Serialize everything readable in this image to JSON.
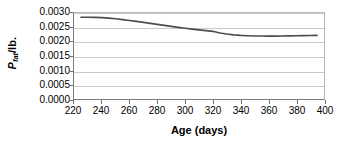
{
  "chart_data": {
    "type": "line",
    "title": "",
    "xlabel": "Age (days)",
    "ylabel": "P_fat/lb.",
    "ylabel_parts": {
      "symbol": "P",
      "subscript": "fat",
      "unit": "/lb."
    },
    "xlim": [
      220,
      400
    ],
    "ylim": [
      0.0,
      0.003
    ],
    "grid": true,
    "grid_axis": "y",
    "legend": "none",
    "xticks": [
      220,
      240,
      260,
      280,
      300,
      320,
      340,
      360,
      380,
      400
    ],
    "xtick_labels": [
      "220",
      "240",
      "260",
      "280",
      "300",
      "320",
      "340",
      "360",
      "380",
      "400"
    ],
    "yticks": [
      0.0,
      0.0005,
      0.001,
      0.0015,
      0.002,
      0.0025,
      0.003
    ],
    "ytick_labels": [
      "0.0000",
      "0.0005",
      "0.0010",
      "0.0015",
      "0.0020",
      "0.0025",
      "0.0030"
    ],
    "series": [
      {
        "name": "P_fat/lb.",
        "color": "#4d4d4d",
        "line_width": 1.6,
        "x": [
          225,
          230,
          235,
          240,
          245,
          250,
          255,
          260,
          265,
          270,
          275,
          280,
          285,
          290,
          295,
          300,
          305,
          310,
          315,
          320,
          325,
          330,
          335,
          340,
          345,
          350,
          355,
          360,
          365,
          370,
          375,
          380,
          385,
          390,
          395
        ],
        "y": [
          0.00285,
          0.002852,
          0.002848,
          0.002838,
          0.00282,
          0.002797,
          0.00277,
          0.00274,
          0.002707,
          0.002672,
          0.002637,
          0.002602,
          0.002567,
          0.002533,
          0.0025,
          0.002468,
          0.002438,
          0.00241,
          0.002384,
          0.00236,
          0.0023,
          0.002265,
          0.002238,
          0.00222,
          0.002208,
          0.0022,
          0.002196,
          0.002194,
          0.002194,
          0.002197,
          0.002202,
          0.002208,
          0.002212,
          0.002216,
          0.00222
        ]
      }
    ]
  }
}
